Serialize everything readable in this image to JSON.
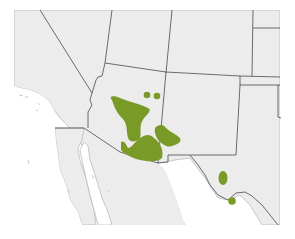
{
  "map": {
    "type": "species-range-map",
    "region": "Southwestern United States and northern Mexico",
    "colors": {
      "background": "#ffffff",
      "land": "#ececec",
      "border": "#4a4a4a",
      "coast": "#9a9a9a",
      "range": "#7a9a28"
    },
    "range_areas": [
      {
        "name": "central-arizona-range"
      },
      {
        "name": "southeast-arizona-range"
      },
      {
        "name": "southwest-new-mexico-range"
      },
      {
        "name": "northern-arizona-dot-1"
      },
      {
        "name": "northern-arizona-dot-2"
      },
      {
        "name": "west-texas-range"
      },
      {
        "name": "big-bend-range"
      }
    ]
  }
}
